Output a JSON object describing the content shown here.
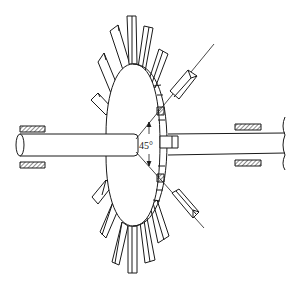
{
  "figure": {
    "type": "technical line drawing",
    "colors": {
      "stroke": "#1a1a1a",
      "background": "#ffffff",
      "fill": "#ffffff"
    }
  },
  "annotations": {
    "angle_label": "45°"
  },
  "components": [
    {
      "name": "left-shaft",
      "description": "cylindrical shaft extending left, with elliptical end face"
    },
    {
      "name": "right-shaft",
      "description": "shaft extending right to a broken end"
    },
    {
      "name": "disc",
      "description": "elliptical disc seen obliquely"
    },
    {
      "name": "blades",
      "count": 18,
      "description": "rectangular radial blades around the disc rim"
    },
    {
      "name": "detached-blades",
      "count": 2,
      "description": "two blades shown displaced along 45° construction lines"
    },
    {
      "name": "bearings",
      "count": 4,
      "description": "hatched bearing blocks above and below each shaft"
    },
    {
      "name": "hub-key",
      "description": "small rectangular hub/key on right face of disc"
    }
  ]
}
